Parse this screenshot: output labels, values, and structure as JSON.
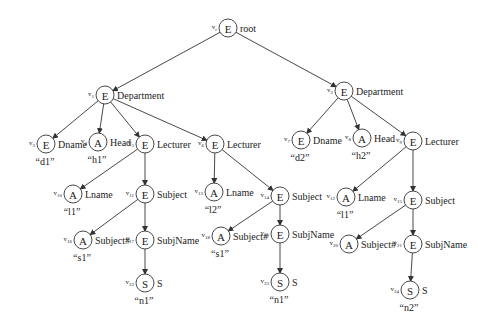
{
  "diagram": {
    "type": "xml-tree",
    "colors": {
      "stroke": "#333333",
      "text": "#222222",
      "background": "#ffffff"
    },
    "nodes": [
      {
        "key": "root",
        "id": "vr",
        "id_main": "v",
        "id_sub": "r",
        "type": "E",
        "label": "root",
        "value": "",
        "x": 228,
        "y": 28
      },
      {
        "key": "dept1",
        "id": "v1",
        "id_main": "v",
        "id_sub": "1",
        "type": "E",
        "label": "Department",
        "value": "",
        "x": 105,
        "y": 95
      },
      {
        "key": "dname1",
        "id": "v3",
        "id_main": "v",
        "id_sub": "3",
        "type": "E",
        "label": "Dname",
        "value": "“d1”",
        "x": 46,
        "y": 144
      },
      {
        "key": "head1",
        "id": "v4",
        "id_main": "v",
        "id_sub": "4",
        "type": "A",
        "label": "Head",
        "value": "“h1”",
        "x": 98,
        "y": 142
      },
      {
        "key": "lect5",
        "id": "v5",
        "id_main": "v",
        "id_sub": "5",
        "type": "E",
        "label": "Lecturer",
        "value": "",
        "x": 145,
        "y": 144
      },
      {
        "key": "lect6",
        "id": "v6",
        "id_main": "v",
        "id_sub": "6",
        "type": "E",
        "label": "Lecturer",
        "value": "",
        "x": 215,
        "y": 144
      },
      {
        "key": "lname10",
        "id": "v10",
        "id_main": "v",
        "id_sub": "10",
        "type": "A",
        "label": "Lname",
        "value": "“l1”",
        "x": 73,
        "y": 194
      },
      {
        "key": "subj11",
        "id": "v11",
        "id_main": "v",
        "id_sub": "11",
        "type": "E",
        "label": "Subject",
        "value": "",
        "x": 145,
        "y": 194
      },
      {
        "key": "subjno16",
        "id": "v16",
        "id_main": "v",
        "id_sub": "16",
        "type": "A",
        "label": "Subject#",
        "value": "“s1”",
        "x": 83,
        "y": 240
      },
      {
        "key": "subjname17",
        "id": "v17",
        "id_main": "v",
        "id_sub": "17",
        "type": "E",
        "label": "SubjName",
        "value": "",
        "x": 145,
        "y": 240
      },
      {
        "key": "s22",
        "id": "v22",
        "id_main": "v",
        "id_sub": "22",
        "type": "S",
        "label": "S",
        "value": "“n1”",
        "x": 145,
        "y": 283
      },
      {
        "key": "lname13",
        "id": "v13",
        "id_main": "v",
        "id_sub": "13",
        "type": "A",
        "label": "Lname",
        "value": "“l2”",
        "x": 214,
        "y": 192
      },
      {
        "key": "subj14",
        "id": "v14",
        "id_main": "v",
        "id_sub": "14",
        "type": "E",
        "label": "Subject",
        "value": "",
        "x": 280,
        "y": 196
      },
      {
        "key": "subjno18",
        "id": "v18",
        "id_main": "v",
        "id_sub": "18",
        "type": "A",
        "label": "Subject#",
        "value": "“s1”",
        "x": 221,
        "y": 236
      },
      {
        "key": "subjname19",
        "id": "v19",
        "id_main": "v",
        "id_sub": "19",
        "type": "E",
        "label": "SubjName",
        "value": "",
        "x": 280,
        "y": 234
      },
      {
        "key": "s23",
        "id": "v23",
        "id_main": "v",
        "id_sub": "23",
        "type": "S",
        "label": "S",
        "value": "“n1”",
        "x": 280,
        "y": 282
      },
      {
        "key": "dept2",
        "id": "v2",
        "id_main": "v",
        "id_sub": "2",
        "type": "E",
        "label": "Department",
        "value": "",
        "x": 344,
        "y": 91
      },
      {
        "key": "dname7",
        "id": "v7",
        "id_main": "v",
        "id_sub": "7",
        "type": "E",
        "label": "Dname",
        "value": "“d2”",
        "x": 301,
        "y": 140
      },
      {
        "key": "head8",
        "id": "v8",
        "id_main": "v",
        "id_sub": "8",
        "type": "A",
        "label": "Head",
        "value": "“h2”",
        "x": 362,
        "y": 138
      },
      {
        "key": "lect9",
        "id": "v9",
        "id_main": "v",
        "id_sub": "9",
        "type": "E",
        "label": "Lecturer",
        "value": "",
        "x": 413,
        "y": 141
      },
      {
        "key": "lname12",
        "id": "v12",
        "id_main": "v",
        "id_sub": "12",
        "type": "A",
        "label": "Lname",
        "value": "“l1”",
        "x": 346,
        "y": 197
      },
      {
        "key": "subj15",
        "id": "v15",
        "id_main": "v",
        "id_sub": "15",
        "type": "E",
        "label": "Subject",
        "value": "",
        "x": 413,
        "y": 200
      },
      {
        "key": "subjno20",
        "id": "v20",
        "id_main": "v",
        "id_sub": "20",
        "type": "A",
        "label": "Subject#",
        "value": "",
        "x": 349,
        "y": 244
      },
      {
        "key": "subjname21",
        "id": "v21",
        "id_main": "v",
        "id_sub": "21",
        "type": "E",
        "label": "SubjName",
        "value": "",
        "x": 413,
        "y": 244
      },
      {
        "key": "s24",
        "id": "v24",
        "id_main": "v",
        "id_sub": "24",
        "type": "S",
        "label": "S",
        "value": "“n2”",
        "x": 410,
        "y": 290
      }
    ],
    "edges": [
      [
        "root",
        "dept1"
      ],
      [
        "root",
        "dept2"
      ],
      [
        "dept1",
        "dname1"
      ],
      [
        "dept1",
        "head1"
      ],
      [
        "dept1",
        "lect5"
      ],
      [
        "dept1",
        "lect6"
      ],
      [
        "lect5",
        "lname10"
      ],
      [
        "lect5",
        "subj11"
      ],
      [
        "subj11",
        "subjno16"
      ],
      [
        "subj11",
        "subjname17"
      ],
      [
        "subjname17",
        "s22"
      ],
      [
        "lect6",
        "lname13"
      ],
      [
        "lect6",
        "subj14"
      ],
      [
        "subj14",
        "subjno18"
      ],
      [
        "subj14",
        "subjname19"
      ],
      [
        "subjname19",
        "s23"
      ],
      [
        "dept2",
        "dname7"
      ],
      [
        "dept2",
        "head8"
      ],
      [
        "dept2",
        "lect9"
      ],
      [
        "lect9",
        "lname12"
      ],
      [
        "lect9",
        "subj15"
      ],
      [
        "subj15",
        "subjno20"
      ],
      [
        "subj15",
        "subjname21"
      ],
      [
        "subjname21",
        "s24"
      ]
    ]
  }
}
